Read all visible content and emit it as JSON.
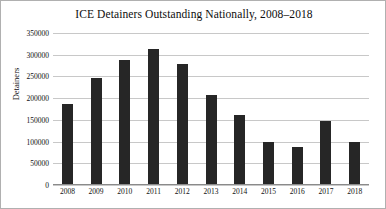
{
  "chart_data": {
    "type": "bar",
    "title": "ICE Detainers Outstanding Nationally, 2008–2018",
    "xlabel": "",
    "ylabel": "Detainers",
    "categories": [
      "2008",
      "2009",
      "2010",
      "2011",
      "2012",
      "2013",
      "2014",
      "2015",
      "2016",
      "2017",
      "2018"
    ],
    "values": [
      185000,
      245000,
      285000,
      310000,
      277000,
      205000,
      160000,
      97000,
      85000,
      145000,
      97000
    ],
    "ylim": [
      0,
      350000
    ],
    "ytick_labels": [
      "0",
      "50000",
      "100000",
      "150000",
      "200000",
      "250000",
      "300000",
      "350000"
    ],
    "ytick_values": [
      0,
      50000,
      100000,
      150000,
      200000,
      250000,
      300000,
      350000
    ],
    "grid": true,
    "legend": false,
    "bar_color": "#262626",
    "grid_color": "#c8c8c8",
    "border_color": "#b0b0b0"
  }
}
